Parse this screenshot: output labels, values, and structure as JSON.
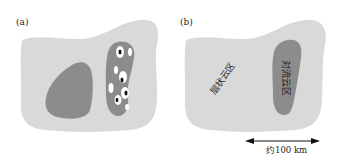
{
  "panels": [
    {
      "label": "(a)",
      "description": "Cloud region with stratiform area and convective band containing cells"
    },
    {
      "label": "(b)",
      "regions": {
        "stratiform": "层状云区",
        "convective": "对流云区"
      }
    }
  ],
  "scale_bar": {
    "text": "约100 km"
  },
  "colors": {
    "outer_cloud": "#d9d9d9",
    "inner_region": "#8c8c8c",
    "cell_white": "#ffffff",
    "cell_core": "#111111",
    "text": "#222222"
  }
}
